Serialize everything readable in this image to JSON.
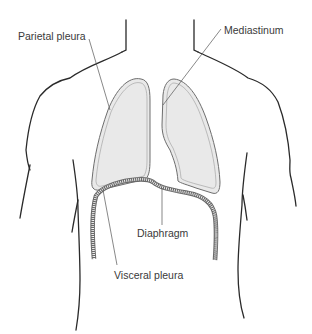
{
  "figure": {
    "colors": {
      "body_outline": "#2a2a2a",
      "pleura_outline": "#6e6e6e",
      "lung_fill": "#e9e9e9",
      "diaphragm_band": "#8a8a8a",
      "leader_line": "#555555",
      "label_text": "#3a3a3a"
    }
  },
  "labels": {
    "parietal_pleura": "Parietal pleura",
    "mediastinum": "Mediastinum",
    "diaphragm": "Diaphragm",
    "visceral_pleura": "Visceral pleura"
  }
}
